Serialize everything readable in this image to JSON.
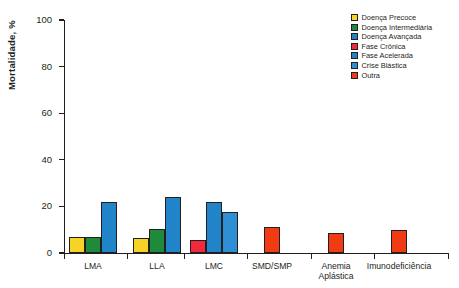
{
  "chart_data": {
    "type": "bar",
    "title": "",
    "xlabel": "",
    "ylabel": "Mortalidade, %",
    "ylim": [
      0,
      100
    ],
    "yticks": [
      0,
      20,
      40,
      60,
      80,
      100
    ],
    "grid": false,
    "legend_position": "top-right",
    "categories": [
      "LMA",
      "LLA",
      "LMC",
      "SMD/SMP",
      "Anemia\nAplástica",
      "Imunodeficiência"
    ],
    "series": [
      {
        "name": "Doença Precoce",
        "color": "#F5D327",
        "values": [
          7,
          6.5,
          null,
          null,
          null,
          null
        ]
      },
      {
        "name": "Doença Intermediária",
        "color": "#1E8A3C",
        "values": [
          7,
          10.5,
          null,
          null,
          null,
          null
        ]
      },
      {
        "name": "Doença Avançada",
        "color": "#2183C8",
        "values": [
          22,
          24,
          null,
          null,
          null,
          null
        ]
      },
      {
        "name": "Fase Crônica",
        "color": "#EE2A3B",
        "values": [
          null,
          null,
          5.5,
          null,
          null,
          null
        ]
      },
      {
        "name": "Fase Acelerada",
        "color": "#2183C8",
        "values": [
          null,
          null,
          22,
          null,
          null,
          null
        ]
      },
      {
        "name": "Crise Blástica",
        "color": "#2E8FD4",
        "values": [
          null,
          null,
          17.5,
          null,
          null,
          null
        ]
      },
      {
        "name": "Outra",
        "color": "#F03B14",
        "values": [
          null,
          null,
          null,
          11,
          8.5,
          10
        ]
      }
    ],
    "bars": [
      {
        "group": "LMA",
        "series": "Doença Precoce",
        "value": 7,
        "color": "#F5D327",
        "x": 69,
        "width": 16
      },
      {
        "group": "LMA",
        "series": "Doença Intermediária",
        "value": 7,
        "color": "#1E8A3C",
        "x": 85,
        "width": 16
      },
      {
        "group": "LMA",
        "series": "Doença Avançada",
        "value": 22,
        "color": "#2183C8",
        "x": 101,
        "width": 16
      },
      {
        "group": "LLA",
        "series": "Doença Precoce",
        "value": 6.5,
        "color": "#F5D327",
        "x": 133,
        "width": 16
      },
      {
        "group": "LLA",
        "series": "Doença Intermediária",
        "value": 10.5,
        "color": "#1E8A3C",
        "x": 149,
        "width": 16
      },
      {
        "group": "LLA",
        "series": "Doença Avançada",
        "value": 24,
        "color": "#2183C8",
        "x": 165,
        "width": 16
      },
      {
        "group": "LMC",
        "series": "Fase Crônica",
        "value": 5.5,
        "color": "#EE2A3B",
        "x": 190,
        "width": 16
      },
      {
        "group": "LMC",
        "series": "Fase Acelerada",
        "value": 22,
        "color": "#2183C8",
        "x": 206,
        "width": 16
      },
      {
        "group": "LMC",
        "series": "Crise Blástica",
        "value": 17.5,
        "color": "#2E8FD4",
        "x": 222,
        "width": 16
      },
      {
        "group": "SMD/SMP",
        "series": "Outra",
        "value": 11,
        "color": "#F03B14",
        "x": 264,
        "width": 16
      },
      {
        "group": "Anemia Aplástica",
        "series": "Outra",
        "value": 8.5,
        "color": "#F03B14",
        "x": 328,
        "width": 16
      },
      {
        "group": "Imunodeficiência",
        "series": "Outra",
        "value": 10,
        "color": "#F03B14",
        "x": 391,
        "width": 16
      }
    ],
    "category_positions": [
      {
        "label": "LMA",
        "center": 93,
        "tick": 64
      },
      {
        "label": "LLA",
        "center": 157,
        "tick": 127
      },
      {
        "label": "LMC",
        "center": 214,
        "tick": 184
      },
      {
        "label": "SMD/SMP",
        "center": 272,
        "tick": 247
      },
      {
        "label": "Anemia\nAplástica",
        "center": 336,
        "tick": 311
      },
      {
        "label": "Imunodeficiência",
        "center": 399,
        "tick": 374
      }
    ],
    "axis_end_tick": 448
  }
}
